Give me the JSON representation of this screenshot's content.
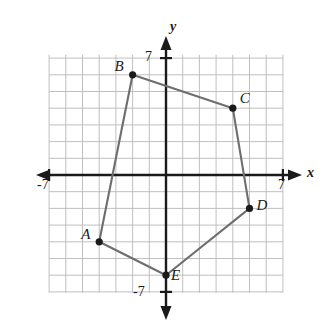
{
  "figure": {
    "background_color": "#ffffff",
    "grid_color": "#b9b9b9",
    "axis_color": "#1a1a1a",
    "polygon_stroke_color": "#6e6e6e",
    "vertex_color": "#1a1a1a"
  },
  "chart_data": {
    "type": "scatter",
    "title": "",
    "xlabel": "x",
    "ylabel": "y",
    "xlim": [
      -7.5,
      7.5
    ],
    "ylim": [
      -7.5,
      7.5
    ],
    "grid": true,
    "grid_step": 1,
    "legend": "none",
    "x_tick_labels": [
      "-7",
      "7"
    ],
    "x_tick_values": [
      -7,
      7
    ],
    "y_tick_labels": [
      "7",
      "-7"
    ],
    "y_tick_values": [
      7,
      -7
    ],
    "series": [
      {
        "name": "Polygon ABCDE",
        "closed": true,
        "points": [
          {
            "label": "A",
            "x": -4,
            "y": -4,
            "label_dx": -18,
            "label_dy": -8
          },
          {
            "label": "B",
            "x": -2,
            "y": 6,
            "label_dx": -18,
            "label_dy": -9
          },
          {
            "label": "C",
            "x": 4,
            "y": 4,
            "label_dx": 7,
            "label_dy": -10
          },
          {
            "label": "D",
            "x": 5,
            "y": -2,
            "label_dx": 7,
            "label_dy": -3
          },
          {
            "label": "E",
            "x": 0,
            "y": -6,
            "label_dx": 5,
            "label_dy": 0
          }
        ]
      }
    ]
  },
  "axes": {
    "x_axis_name": "x",
    "y_axis_name": "y",
    "x_negative_tick_label": "-7",
    "x_positive_tick_label": "7",
    "y_positive_tick_label": "7",
    "y_negative_tick_label": "-7"
  }
}
